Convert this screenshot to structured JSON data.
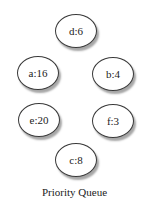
{
  "diagram": {
    "caption": "Priority Queue",
    "nodes": [
      {
        "id": "d",
        "label": "d:6",
        "key": "d",
        "freq": 6,
        "cx": 76,
        "cy": 31
      },
      {
        "id": "a",
        "label": "a:16",
        "key": "a",
        "freq": 16,
        "cx": 38,
        "cy": 73
      },
      {
        "id": "b",
        "label": "b:4",
        "key": "b",
        "freq": 4,
        "cx": 113,
        "cy": 74
      },
      {
        "id": "e",
        "label": "e:20",
        "key": "e",
        "freq": 20,
        "cx": 39,
        "cy": 120
      },
      {
        "id": "f",
        "label": "f:3",
        "key": "f",
        "freq": 3,
        "cx": 113,
        "cy": 121
      },
      {
        "id": "c",
        "label": "c:8",
        "key": "c",
        "freq": 8,
        "cx": 76,
        "cy": 160
      }
    ]
  }
}
